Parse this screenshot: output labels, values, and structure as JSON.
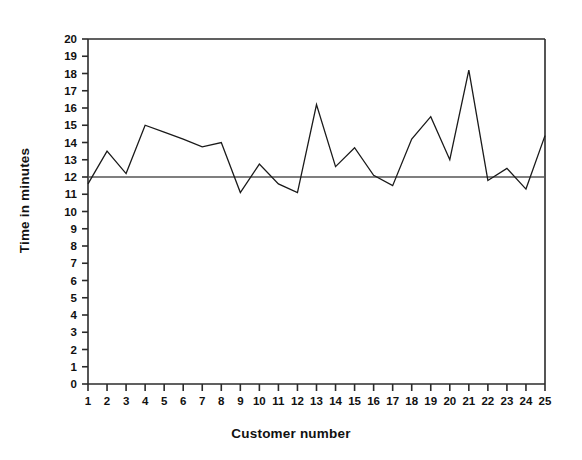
{
  "chart_data": {
    "type": "line",
    "title": "",
    "xlabel": "Customer number",
    "ylabel": "Time in minutes",
    "x": [
      1,
      2,
      3,
      4,
      5,
      6,
      7,
      8,
      9,
      10,
      11,
      12,
      13,
      14,
      15,
      16,
      17,
      18,
      19,
      20,
      21,
      22,
      23,
      24,
      25
    ],
    "values": [
      11.6,
      13.5,
      12.2,
      15.0,
      14.6,
      14.2,
      13.75,
      14.0,
      11.1,
      12.75,
      11.6,
      11.1,
      16.2,
      12.6,
      13.7,
      12.1,
      11.5,
      14.2,
      15.5,
      13.0,
      18.2,
      11.8,
      12.5,
      11.3,
      14.4
    ],
    "series": [
      {
        "name": "Time in minutes",
        "values": [
          11.6,
          13.5,
          12.2,
          15.0,
          14.6,
          14.2,
          13.75,
          14.0,
          11.1,
          12.75,
          11.6,
          11.1,
          16.2,
          12.6,
          13.7,
          12.1,
          11.5,
          14.2,
          15.5,
          13.0,
          18.2,
          11.8,
          12.5,
          11.3,
          14.4
        ],
        "color": "#1a1a1a"
      }
    ],
    "reference_line": {
      "name": "center-line",
      "value": 12,
      "color": "#555555"
    },
    "xlim": [
      1,
      25
    ],
    "ylim": [
      0,
      20
    ],
    "ytick_step": 1,
    "xtick_step": 1,
    "yticks": [
      0,
      1,
      2,
      3,
      4,
      5,
      6,
      7,
      8,
      9,
      10,
      11,
      12,
      13,
      14,
      15,
      16,
      17,
      18,
      19,
      20
    ],
    "ytick_labels": [
      "0",
      "1",
      "2",
      "3",
      "4",
      "5",
      "6",
      "7",
      "8",
      "9",
      "10",
      "11",
      "12",
      "13",
      "14",
      "15",
      "16",
      "17",
      "18",
      "19",
      "20"
    ],
    "xticks": [
      1,
      2,
      3,
      4,
      5,
      6,
      7,
      8,
      9,
      10,
      11,
      12,
      13,
      14,
      15,
      16,
      17,
      18,
      19,
      20,
      21,
      22,
      23,
      24,
      25
    ],
    "xtick_labels": [
      "1",
      "2",
      "3",
      "4",
      "5",
      "6",
      "7",
      "8",
      "9",
      "10",
      "11",
      "12",
      "13",
      "14",
      "15",
      "16",
      "17",
      "18",
      "19",
      "20",
      "21",
      "22",
      "23",
      "24",
      "25"
    ],
    "grid": false,
    "legend": null,
    "legend_position": "none",
    "frame": {
      "top": true,
      "right": true,
      "left": true,
      "bottom": true
    }
  },
  "plot": {
    "background": "#ffffff",
    "axis_color": "#2b2b2b",
    "line_color": "#1a1a1a"
  }
}
